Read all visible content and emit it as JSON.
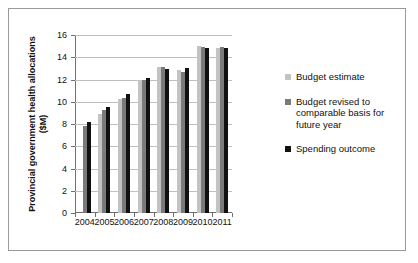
{
  "chart_data": {
    "type": "bar",
    "title": "",
    "xlabel": "",
    "ylabel": "Provincial government health allocations ($M)",
    "categories": [
      "2004",
      "2005",
      "2006",
      "2007",
      "2008",
      "2009",
      "2010",
      "2011"
    ],
    "ylim": [
      0,
      16
    ],
    "yticks": [
      0,
      2,
      4,
      6,
      8,
      10,
      12,
      14,
      16
    ],
    "grid": true,
    "legend_position": "right",
    "series": [
      {
        "name": "Budget estimate",
        "color": "#c3c3c3",
        "values": [
          null,
          8.9,
          10.25,
          11.95,
          13.15,
          12.85,
          15.0,
          14.8
        ]
      },
      {
        "name": "Budget revised to comparable basis for future year",
        "color": "#7a7a7a",
        "values": [
          7.85,
          9.3,
          10.3,
          12.0,
          13.1,
          12.65,
          14.95,
          14.9
        ]
      },
      {
        "name": "Spending outcome",
        "color": "#111111",
        "values": [
          8.2,
          9.55,
          10.7,
          12.1,
          12.95,
          13.05,
          14.8,
          14.85
        ]
      }
    ]
  }
}
